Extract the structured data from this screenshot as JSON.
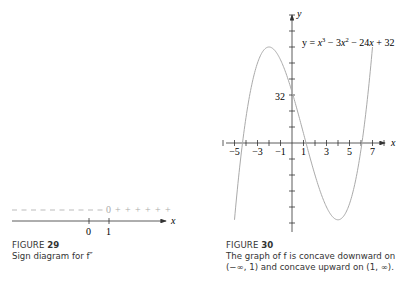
{
  "figure29": {
    "label": "FIGURE",
    "number": "29",
    "caption": "Sign diagram for f″",
    "axis_var": "x",
    "ticks": [
      {
        "value": "0"
      },
      {
        "value": "1"
      }
    ],
    "sign_left": "−",
    "sign_zero": "0",
    "sign_right": "+"
  },
  "figure30": {
    "label": "FIGURE",
    "number": "30",
    "caption_line1": "The graph of f is concave downward on",
    "caption_line2": "(−∞, 1) and concave upward on (1, ∞).",
    "equation": "y = x³ − 3x² − 24x + 32",
    "x_axis_label": "x",
    "y_axis_label": "y",
    "y_marker_label": "32",
    "x_tick_labels": [
      "−5",
      "−3",
      "−1",
      "1",
      "3",
      "5",
      "7"
    ]
  },
  "chart_data": [
    {
      "type": "line",
      "title": "Sign diagram for f″",
      "xlabel": "x",
      "ylabel": "",
      "x": [
        0,
        1
      ],
      "annotations": [
        "− − − … for x < 1",
        "0 at x = 1",
        "+ + + for x > 1"
      ],
      "grid": false
    },
    {
      "type": "line",
      "title": "y = x^3 - 3x^2 - 24x + 32",
      "xlabel": "x",
      "ylabel": "y",
      "xlim": [
        -5.5,
        8
      ],
      "ylim": [
        -55,
        80
      ],
      "x_ticks": [
        -5,
        -3,
        -1,
        1,
        3,
        5,
        7
      ],
      "y_ticks_labeled": [
        32
      ],
      "grid": false,
      "series": [
        {
          "name": "y = x^3 - 3x^2 - 24x + 32",
          "x": [
            -5,
            -4,
            -3,
            -2,
            -1,
            0,
            1,
            2,
            3,
            4,
            5,
            6,
            7
          ],
          "y": [
            -48,
            16,
            50,
            60,
            52,
            32,
            6,
            -20,
            -40,
            -48,
            -38,
            -4,
            60
          ]
        }
      ],
      "annotations": [
        "local max (-2, 60)",
        "local min (4, -48)",
        "inflection point (1, 6)"
      ]
    }
  ]
}
